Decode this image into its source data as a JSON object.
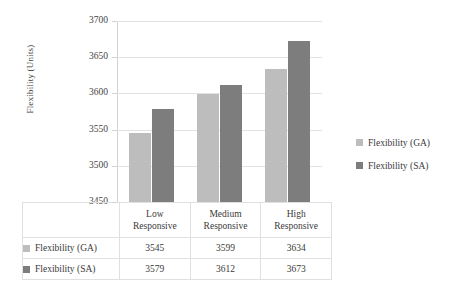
{
  "chart_data": {
    "type": "bar",
    "title": "",
    "xlabel": "",
    "ylabel": "Flexibility (Units)",
    "categories": [
      "Low Responsive",
      "Medium Responsive",
      "High Responsive"
    ],
    "category_lines": [
      [
        "Low",
        "Responsive"
      ],
      [
        "Medium",
        "Responsive"
      ],
      [
        "High",
        "Responsive"
      ]
    ],
    "series": [
      {
        "name": "Flexibility (GA)",
        "values": [
          3545,
          3599,
          3634
        ],
        "color": "#bdbdbd"
      },
      {
        "name": "Flexibility (SA)",
        "values": [
          3579,
          3612,
          3673
        ],
        "color": "#7d7d7d"
      }
    ],
    "ylim": [
      3450,
      3700
    ],
    "y_ticks": [
      3700,
      3650,
      3600,
      3550,
      3500,
      3450
    ],
    "y_tick_labels": [
      "3700",
      "3650",
      "3600",
      "3550",
      "3500",
      "3450"
    ],
    "grid": true,
    "legend_position": "right",
    "has_data_table": true
  },
  "axis": {
    "y_title": "Flexibility (Units)"
  },
  "legend": {
    "entries": [
      {
        "label": "Flexibility (GA)",
        "color": "#bdbdbd",
        "swatch_name": "legend-swatch-ga"
      },
      {
        "label": "Flexibility (SA)",
        "color": "#7d7d7d",
        "swatch_name": "legend-swatch-sa"
      }
    ]
  },
  "table": {
    "category_headers": [
      {
        "line1": "Low",
        "line2": "Responsive"
      },
      {
        "line1": "Medium",
        "line2": "Responsive"
      },
      {
        "line1": "High",
        "line2": "Responsive"
      }
    ],
    "rows": [
      {
        "label": "Flexibility (GA)",
        "color": "#bdbdbd",
        "values": [
          "3545",
          "3599",
          "3634"
        ]
      },
      {
        "label": "Flexibility (SA)",
        "color": "#7d7d7d",
        "values": [
          "3579",
          "3612",
          "3673"
        ]
      }
    ]
  }
}
